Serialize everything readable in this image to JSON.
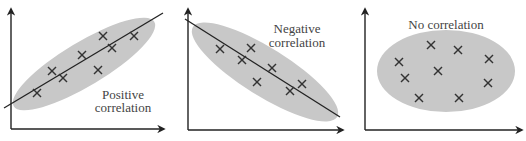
{
  "chart_data": [
    {
      "type": "scatter",
      "title": "",
      "annotation": [
        "Positive",
        "correlation"
      ],
      "xlabel": "",
      "ylabel": "",
      "trend": "positive",
      "trendline": true,
      "points_px": [
        [
          37,
          93
        ],
        [
          52,
          71
        ],
        [
          63,
          78
        ],
        [
          82,
          55
        ],
        [
          98,
          70
        ],
        [
          103,
          36
        ],
        [
          112,
          48
        ],
        [
          134,
          36
        ]
      ],
      "trendline_px": [
        [
          4,
          108
        ],
        [
          163,
          13
        ]
      ]
    },
    {
      "type": "scatter",
      "title": "",
      "annotation": [
        "Negative",
        "correlation"
      ],
      "xlabel": "",
      "ylabel": "",
      "trend": "negative",
      "trendline": true,
      "points_px": [
        [
          220,
          49
        ],
        [
          242,
          60
        ],
        [
          251,
          48
        ],
        [
          257,
          82
        ],
        [
          272,
          68
        ],
        [
          290,
          91
        ],
        [
          302,
          84
        ]
      ],
      "trendline_px": [
        [
          185,
          19
        ],
        [
          340,
          117
        ]
      ]
    },
    {
      "type": "scatter",
      "title": "",
      "annotation": [
        "No correlation"
      ],
      "xlabel": "",
      "ylabel": "",
      "trend": "none",
      "trendline": false,
      "points_px": [
        [
          399,
          62
        ],
        [
          405,
          78
        ],
        [
          419,
          98
        ],
        [
          431,
          45
        ],
        [
          438,
          71
        ],
        [
          458,
          50
        ],
        [
          459,
          98
        ],
        [
          488,
          83
        ],
        [
          489,
          59
        ]
      ]
    }
  ],
  "labels": {
    "panel1_line1": "Positive",
    "panel1_line2": "correlation",
    "panel2_line1": "Negative",
    "panel2_line2": "correlation",
    "panel3_line1": "No correlation"
  },
  "colors": {
    "axis": "#222222",
    "ellipse": "#c8c8c8",
    "marker": "#333333",
    "text": "#444444"
  }
}
